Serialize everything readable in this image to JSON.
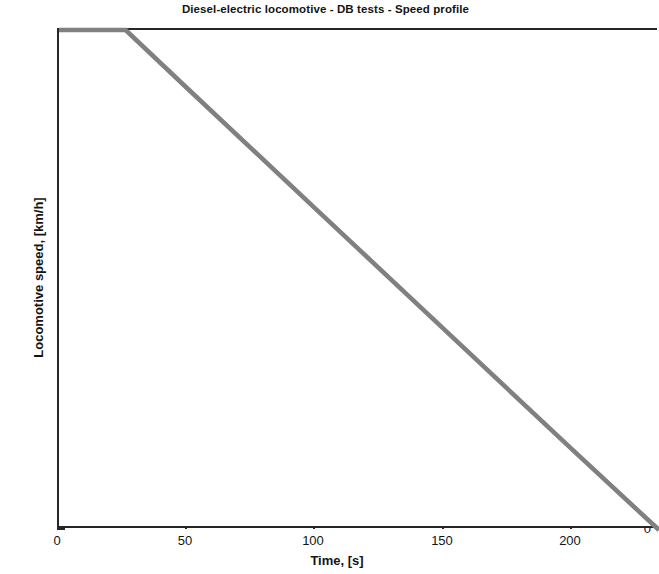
{
  "chart_data": {
    "type": "line",
    "title": "Diesel-electric locomotive - DB tests - Speed profile",
    "xlabel": "Time, [s]",
    "ylabel": "Locomotive speed, [km/h]",
    "xlim": [
      0,
      234
    ],
    "ylim": [
      0,
      133
    ],
    "xticks": [
      0,
      50,
      100,
      150,
      200
    ],
    "xtick_labels": [
      "0",
      "50",
      "100",
      "150",
      "200"
    ],
    "yticks": [
      0,
      20,
      40,
      60,
      80,
      100,
      120
    ],
    "ytick_labels": [
      "0",
      "20",
      "40",
      "60",
      "80",
      "100",
      "120"
    ],
    "grid": false,
    "legend": null,
    "line_color": "#808080",
    "axis_color": "#262626",
    "background": "#ffffff",
    "series": [
      {
        "name": "Locomotive speed",
        "x": [
          0,
          26,
          50,
          100,
          150,
          200,
          234
        ],
        "y": [
          133,
          133,
          117.5,
          85.5,
          53.5,
          21.5,
          0
        ]
      }
    ],
    "annotations": [
      "Constant speed ~133 km/h until t = 26 s",
      "Linear deceleration of about 0.64 km/h per second after t = 26 s",
      "Speed reaches 0 km/h near t = 234 s",
      "Plot is cropped at the right edge of the image"
    ]
  }
}
